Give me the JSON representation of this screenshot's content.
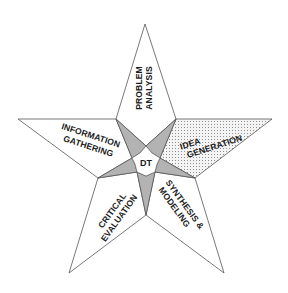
{
  "diagram": {
    "type": "star",
    "center_label": "DT",
    "segments": [
      {
        "id": "problem-analysis",
        "lines": [
          "PROBLEM",
          "ANALYSIS"
        ],
        "highlighted": false
      },
      {
        "id": "idea-generation",
        "lines": [
          "IDEA",
          "GENERATION"
        ],
        "highlighted": true
      },
      {
        "id": "synthesis-modeling",
        "lines": [
          "SYNTHESIS &",
          "MODELING"
        ],
        "highlighted": false
      },
      {
        "id": "critical-evaluation",
        "lines": [
          "CRITICAL",
          "EVALUATION"
        ],
        "highlighted": false
      },
      {
        "id": "information-gathering",
        "lines": [
          "INFORMATION",
          "GATHERING"
        ],
        "highlighted": false
      }
    ],
    "colors": {
      "outline": "#555555",
      "hub_fill": "#b3b3b3",
      "highlight_dots": "#9a9a9a",
      "arm_fill": "#ffffff"
    }
  }
}
